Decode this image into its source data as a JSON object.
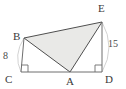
{
  "figure": {
    "type": "geometry-diagram",
    "background_color": "#ffffff",
    "stroke_color": "#4f4f4f",
    "light_stroke_color": "#b9b9b9",
    "shade_fill_color": "#e9e9e7",
    "points": {
      "B": {
        "label": "B",
        "x": 24,
        "y": 38,
        "label_x": 13,
        "label_y": 31
      },
      "C": {
        "label": "C",
        "x": 21,
        "y": 72,
        "label_x": 5,
        "label_y": 74
      },
      "A": {
        "label": "A",
        "x": 70,
        "y": 72,
        "label_x": 66,
        "label_y": 76
      },
      "D": {
        "label": "D",
        "x": 102,
        "y": 72,
        "label_x": 105,
        "label_y": 74
      },
      "E": {
        "label": "E",
        "x": 102,
        "y": 22,
        "label_x": 98,
        "label_y": 3
      }
    },
    "measures": [
      {
        "name": "BC",
        "label": "8",
        "label_x": 3,
        "label_y": 51
      },
      {
        "name": "ED",
        "label": "15",
        "label_x": 108,
        "label_y": 39
      }
    ],
    "right_angles": [
      {
        "name": "right-angle-at-C",
        "vertex": "C",
        "size": 7
      },
      {
        "name": "right-angle-at-D",
        "vertex": "D",
        "size": 7
      }
    ],
    "segments": [
      {
        "name": "segment-BC",
        "from": "B",
        "to": "C"
      },
      {
        "name": "segment-CD",
        "from": "C",
        "to": "D"
      },
      {
        "name": "segment-ED",
        "from": "E",
        "to": "D"
      },
      {
        "name": "segment-BE",
        "from": "B",
        "to": "E"
      },
      {
        "name": "segment-BA",
        "from": "B",
        "to": "A"
      },
      {
        "name": "segment-AE",
        "from": "A",
        "to": "E"
      }
    ],
    "shaded_triangle": {
      "name": "triangle-BEA",
      "vertices": [
        "B",
        "E",
        "A"
      ]
    },
    "arcs": [
      {
        "name": "arc-left-BC",
        "from": "B",
        "to": "C"
      },
      {
        "name": "arc-right-ED",
        "from": "E",
        "to": "D"
      }
    ]
  }
}
